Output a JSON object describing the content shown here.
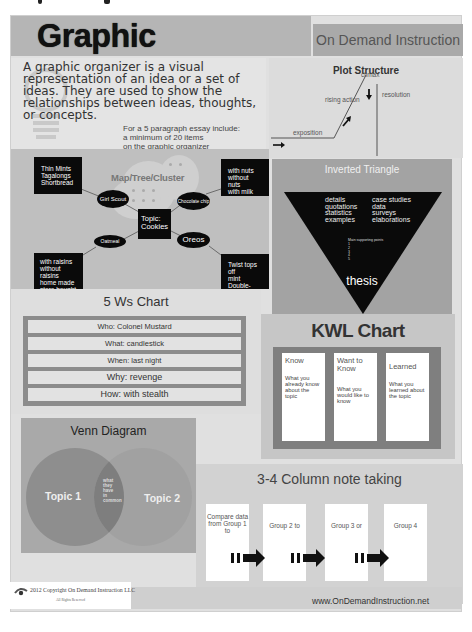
{
  "header": {
    "title": "Graphic Organizers",
    "subtitle": "On Demand Instruction"
  },
  "intro": {
    "text": "A graphic organizer is a visual representation of an idea or a set of ideas. They are used to show the relationships between ideas, thoughts, or concepts.",
    "note_lines": [
      "For a 5 paragraph essay include:",
      "a minimum of 20 items",
      "on the graphic organizer"
    ]
  },
  "plot_structure": {
    "title": "Plot Structure",
    "labels": {
      "climax": "climax",
      "rising_action": "rising action",
      "resolution": "resolution",
      "exposition": "exposition"
    }
  },
  "map_cluster": {
    "title": "Map/Tree/Cluster",
    "topic": "Topic: Cookies",
    "nodes": [
      {
        "label": "Girl Scout",
        "details": [
          "Thin Mints",
          "Tagalongs",
          "Shortbread"
        ]
      },
      {
        "label": "Chocolate chip",
        "details": [
          "with nuts",
          "without nuts",
          "with milk"
        ]
      },
      {
        "label": "Oatmeal",
        "details": [
          "with raisins",
          "without raisins",
          "home made",
          "store bought"
        ]
      },
      {
        "label": "Oreos",
        "details": [
          "Twist tops off",
          "mint",
          "Double-Stuf"
        ]
      }
    ]
  },
  "inverted_triangle": {
    "title": "Inverted Triangle",
    "left_items": [
      "details",
      "quotations",
      "statistics",
      "examples"
    ],
    "right_items": [
      "case studies",
      "data",
      "surveys",
      "elaborations"
    ],
    "main_points_label": "Main supporting points",
    "main_points_numbers": [
      "1",
      "2",
      "3",
      "4",
      "5"
    ],
    "thesis": "thesis"
  },
  "five_ws": {
    "title": "5 Ws Chart",
    "rows": [
      "Who: Colonel Mustard",
      "What: candlestick",
      "When: last night",
      "Why: revenge",
      "How: with stealth"
    ]
  },
  "kwl": {
    "title": "KWL Chart",
    "columns": [
      {
        "head": "Know",
        "body": "What you already know about the topic"
      },
      {
        "head": "Want to Know",
        "body": "What you would like to know"
      },
      {
        "head": "Learned",
        "body": "What you learned about the topic"
      }
    ]
  },
  "venn": {
    "title": "Venn Diagram",
    "left": "Topic 1",
    "right": "Topic 2",
    "common_lines": [
      "what",
      "they",
      "have",
      "in",
      "common"
    ]
  },
  "column_notes": {
    "title": "3-4 Column note taking",
    "columns": [
      "Compare data from Group 1 to",
      "Group 2 to",
      "Group 3 or",
      "Group 4"
    ]
  },
  "footer": {
    "copyright": "2012 Copyright On Demand Instruction LLC",
    "rights": "All Rights Reserved",
    "website": "www.OnDemandInstruction.net"
  },
  "colors": {
    "header_bg": "#b5b5b5",
    "poster_bg": "#e0e0e0",
    "dark_node": "#0a0a0a",
    "triangle_panel": "#a3a3a3",
    "kwl_frame": "#7f7f7f",
    "venn_circle": "#8a8a8a"
  }
}
